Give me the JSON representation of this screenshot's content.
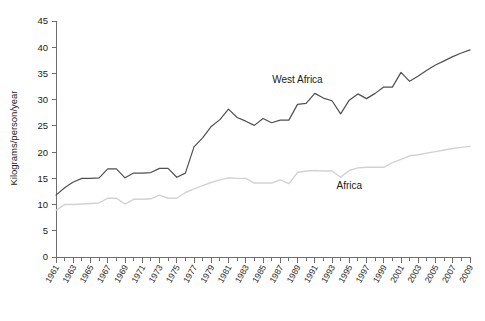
{
  "chart_data": {
    "type": "line",
    "title": "",
    "xlabel": "",
    "ylabel": "Kilograms/person/year",
    "ylim": [
      0,
      45
    ],
    "xlim": [
      1961,
      2009
    ],
    "yticks": [
      0,
      5,
      10,
      15,
      20,
      25,
      30,
      35,
      40,
      45
    ],
    "ytick_labels": [
      "0",
      "5",
      "10",
      "15",
      "20",
      "25",
      "30",
      "35",
      "40",
      "45"
    ],
    "xtick_labels": [
      "1961",
      "1963",
      "1965",
      "1967",
      "1969",
      "1971",
      "1973",
      "1975",
      "1977",
      "1979",
      "1981",
      "1983",
      "1985",
      "1987",
      "1989",
      "1991",
      "1993",
      "1995",
      "1997",
      "1999",
      "2001",
      "2003",
      "2005",
      "2007",
      "2009"
    ],
    "grid": false,
    "legend_position": "inline-annotation",
    "x": [
      1961,
      1962,
      1963,
      1964,
      1965,
      1966,
      1967,
      1968,
      1969,
      1970,
      1971,
      1972,
      1973,
      1974,
      1975,
      1976,
      1977,
      1978,
      1979,
      1980,
      1981,
      1982,
      1983,
      1984,
      1985,
      1986,
      1987,
      1988,
      1989,
      1990,
      1991,
      1992,
      1993,
      1994,
      1995,
      1996,
      1997,
      1998,
      1999,
      2000,
      2001,
      2002,
      2003,
      2004,
      2005,
      2006,
      2007,
      2008,
      2009
    ],
    "series": [
      {
        "name": "West Africa",
        "color": "#4f4f4f",
        "annotation_x": 1989,
        "annotation_y": 33.2,
        "values": [
          11.8,
          13.2,
          14.3,
          15.0,
          15.0,
          15.1,
          16.8,
          16.8,
          15.1,
          16.0,
          16.0,
          16.1,
          16.9,
          16.9,
          15.2,
          16.0,
          21.0,
          22.7,
          24.9,
          26.2,
          28.2,
          26.6,
          25.9,
          25.1,
          26.4,
          25.6,
          26.1,
          26.1,
          29.1,
          29.3,
          31.2,
          30.3,
          29.8,
          27.3,
          29.9,
          31.1,
          30.2,
          31.2,
          32.4,
          32.4,
          35.2,
          33.5,
          34.5,
          35.6,
          36.6,
          37.4,
          38.2,
          38.9,
          39.5
        ]
      },
      {
        "name": "Africa",
        "color": "#d2d2d2",
        "annotation_x": 1995,
        "annotation_y": 13.0,
        "values": [
          8.9,
          10.0,
          10.0,
          10.1,
          10.2,
          10.3,
          11.2,
          11.2,
          10.1,
          11.0,
          11.0,
          11.1,
          11.8,
          11.2,
          11.2,
          12.3,
          13.0,
          13.6,
          14.2,
          14.7,
          15.1,
          15.0,
          15.0,
          14.1,
          14.1,
          14.1,
          14.7,
          14.0,
          16.1,
          16.4,
          16.5,
          16.4,
          16.4,
          15.2,
          16.5,
          17.0,
          17.1,
          17.1,
          17.1,
          18.0,
          18.6,
          19.3,
          19.5,
          19.8,
          20.1,
          20.4,
          20.7,
          20.9,
          21.1
        ]
      }
    ]
  }
}
